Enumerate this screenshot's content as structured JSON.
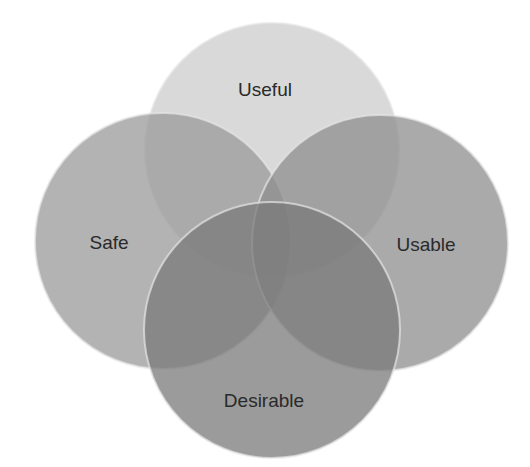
{
  "diagram": {
    "type": "venn",
    "title": "",
    "background": "#ffffff",
    "stroke_color": "#e6e6e6",
    "circles": [
      {
        "id": "useful",
        "label": "Useful",
        "cx": 272,
        "cy": 150,
        "r": 127,
        "fill": "#d2d2d2",
        "opacity": 0.85,
        "label_x": 265,
        "label_y": 96
      },
      {
        "id": "safe",
        "label": "Safe",
        "cx": 163,
        "cy": 241,
        "r": 128,
        "fill": "#9a9a9a",
        "opacity": 0.75,
        "label_x": 109,
        "label_y": 249
      },
      {
        "id": "usable",
        "label": "Usable",
        "cx": 380,
        "cy": 243,
        "r": 128,
        "fill": "#8d8d8d",
        "opacity": 0.75,
        "label_x": 426,
        "label_y": 251
      },
      {
        "id": "desirable",
        "label": "Desirable",
        "cx": 272,
        "cy": 330,
        "r": 128,
        "fill": "#7a7a7a",
        "opacity": 0.75,
        "label_x": 264,
        "label_y": 407
      }
    ]
  }
}
